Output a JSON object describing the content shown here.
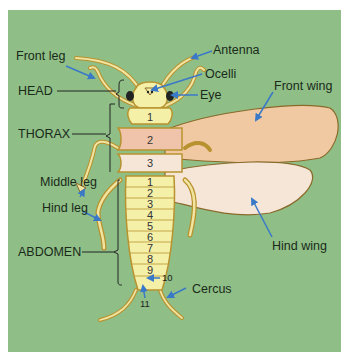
{
  "diagram": {
    "colors": {
      "background": "#8fbf87",
      "body_yellow": "#f4f0a8",
      "body_outline": "#b8922e",
      "thorax_pink": "#efc4aa",
      "front_wing": "#f0c9a3",
      "hind_wing": "#f6e6d8",
      "arrow": "#3a78c8",
      "leader": "#222222"
    },
    "region_labels": {
      "head": "HEAD",
      "thorax": "THORAX",
      "abdomen": "ABDOMEN"
    },
    "part_labels": {
      "front_leg": "Front leg",
      "antenna": "Antenna",
      "ocelli": "Ocelli",
      "eye": "Eye",
      "front_wing": "Front wing",
      "middle_leg": "Middle leg",
      "hind_leg": "Hind leg",
      "hind_wing": "Hind wing",
      "cercus": "Cercus"
    },
    "thorax_segments": [
      "1",
      "2",
      "3"
    ],
    "abdomen_segments": [
      "1",
      "2",
      "3",
      "4",
      "5",
      "6",
      "7",
      "8",
      "9"
    ],
    "abdomen_tail_labels": [
      "10",
      "11"
    ]
  }
}
